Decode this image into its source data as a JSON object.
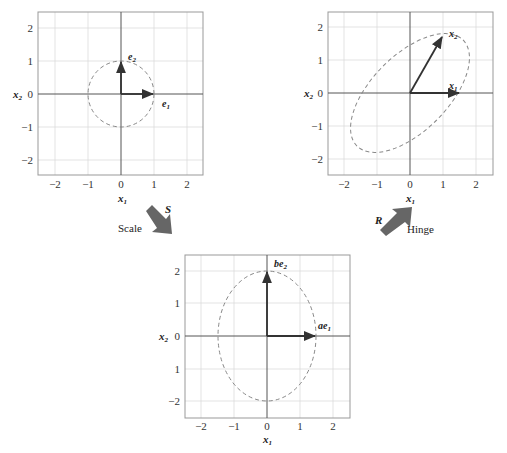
{
  "diagram": {
    "panels": [
      {
        "id": "original",
        "xlabel": "x1",
        "ylabel": "x2",
        "xticks": [
          "−2",
          "−1",
          "0",
          "1",
          "2"
        ],
        "yticks": [
          "2",
          "1",
          "0",
          "−1",
          "−2"
        ],
        "shape": "circle",
        "vectors": [
          {
            "label": "e1",
            "to": [
              1,
              0
            ]
          },
          {
            "label": "e2",
            "to": [
              0,
              1
            ]
          }
        ]
      },
      {
        "id": "rotated",
        "xlabel": "x1",
        "ylabel": "x2",
        "xticks": [
          "−2",
          "−1",
          "0",
          "1",
          "2"
        ],
        "yticks": [
          "2",
          "1",
          "0",
          "−1",
          "−2"
        ],
        "shape": "tilted-ellipse",
        "vectors": [
          {
            "label": "x1",
            "to": [
              1.5,
              0
            ]
          },
          {
            "label": "x2",
            "to": [
              1.0,
              1.75
            ]
          }
        ]
      },
      {
        "id": "scaled",
        "xlabel": "x1",
        "ylabel": "x2",
        "xticks": [
          "−2",
          "−1",
          "0",
          "1",
          "2"
        ],
        "yticks": [
          "2",
          "1",
          "0",
          "1",
          "−2"
        ],
        "shape": "axis-aligned-ellipse",
        "vectors": [
          {
            "label": "ae1",
            "to": [
              1.5,
              0
            ]
          },
          {
            "label": "be2",
            "to": [
              0,
              2
            ]
          }
        ]
      }
    ],
    "transforms": [
      {
        "matrix": "S",
        "caption": "Scale"
      },
      {
        "matrix": "R",
        "caption": "Hinge"
      }
    ]
  }
}
